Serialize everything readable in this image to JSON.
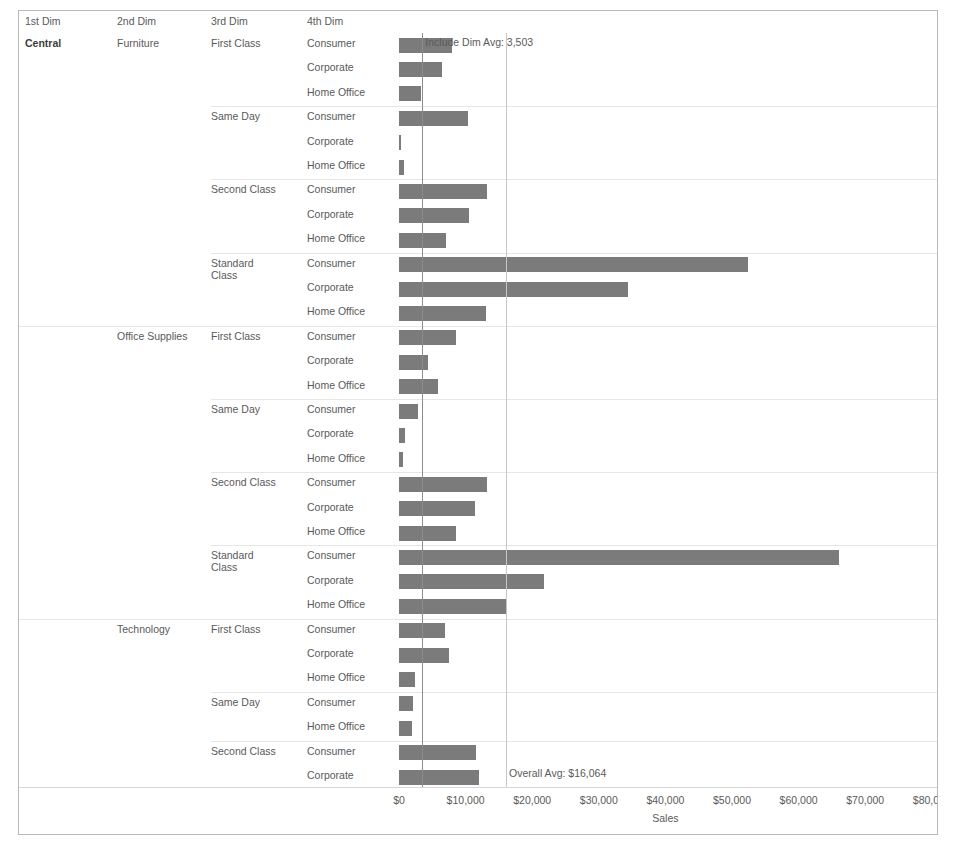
{
  "headers": {
    "dim1": "1st Dim",
    "dim2": "2nd Dim",
    "dim3": "3rd Dim",
    "dim4": "4th Dim"
  },
  "reference_lines": [
    {
      "name": "include-dim-avg",
      "label": "Include Dim Avg: 3,503",
      "value": 3503,
      "color": "#8d8d8d"
    },
    {
      "name": "overall-avg",
      "label": "Overall Avg: $16,064",
      "value": 16064,
      "color": "#c6c6c6"
    }
  ],
  "chart_data": {
    "type": "bar",
    "orientation": "horizontal",
    "title": "",
    "xlabel": "Sales",
    "ylabel": "",
    "xlim": [
      0,
      85000
    ],
    "xticks": [
      0,
      10000,
      20000,
      30000,
      40000,
      50000,
      60000,
      70000,
      80000
    ],
    "xticklabels": [
      "$0",
      "$10,000",
      "$20,000",
      "$30,000",
      "$40,000",
      "$50,000",
      "$60,000",
      "$70,000",
      "$80,000"
    ],
    "grid": false,
    "legend": "none",
    "bar_color": "#7b7b7b",
    "dimensions": [
      "1st Dim",
      "2nd Dim",
      "3rd Dim",
      "4th Dim"
    ],
    "rows": [
      {
        "dim1": "Central",
        "dim2": "Furniture",
        "dim3": "First Class",
        "dim4": "Consumer",
        "value": 8000,
        "group_start": true,
        "cat_start": true,
        "region_start": true
      },
      {
        "dim1": "",
        "dim2": "",
        "dim3": "",
        "dim4": "Corporate",
        "value": 6400,
        "group_start": false,
        "cat_start": false,
        "region_start": false
      },
      {
        "dim1": "",
        "dim2": "",
        "dim3": "",
        "dim4": "Home Office",
        "value": 3300,
        "group_start": false,
        "cat_start": false,
        "region_start": false
      },
      {
        "dim1": "",
        "dim2": "",
        "dim3": "Same Day",
        "dim4": "Consumer",
        "value": 10400,
        "group_start": true,
        "cat_start": false,
        "region_start": false
      },
      {
        "dim1": "",
        "dim2": "",
        "dim3": "",
        "dim4": "Corporate",
        "value": 200,
        "group_start": false,
        "cat_start": false,
        "region_start": false
      },
      {
        "dim1": "",
        "dim2": "",
        "dim3": "",
        "dim4": "Home Office",
        "value": 800,
        "group_start": false,
        "cat_start": false,
        "region_start": false
      },
      {
        "dim1": "",
        "dim2": "",
        "dim3": "Second Class",
        "dim4": "Consumer",
        "value": 13200,
        "group_start": true,
        "cat_start": false,
        "region_start": false
      },
      {
        "dim1": "",
        "dim2": "",
        "dim3": "",
        "dim4": "Corporate",
        "value": 10500,
        "group_start": false,
        "cat_start": false,
        "region_start": false
      },
      {
        "dim1": "",
        "dim2": "",
        "dim3": "",
        "dim4": "Home Office",
        "value": 7100,
        "group_start": false,
        "cat_start": false,
        "region_start": false
      },
      {
        "dim1": "",
        "dim2": "",
        "dim3": "Standard Class",
        "dim4": "Consumer",
        "value": 52400,
        "group_start": true,
        "cat_start": false,
        "region_start": false
      },
      {
        "dim1": "",
        "dim2": "",
        "dim3": "",
        "dim4": "Corporate",
        "value": 34400,
        "group_start": false,
        "cat_start": false,
        "region_start": false
      },
      {
        "dim1": "",
        "dim2": "",
        "dim3": "",
        "dim4": "Home Office",
        "value": 13000,
        "group_start": false,
        "cat_start": false,
        "region_start": false
      },
      {
        "dim1": "",
        "dim2": "Office Supplies",
        "dim3": "First Class",
        "dim4": "Consumer",
        "value": 8500,
        "group_start": true,
        "cat_start": true,
        "region_start": false
      },
      {
        "dim1": "",
        "dim2": "",
        "dim3": "",
        "dim4": "Corporate",
        "value": 4300,
        "group_start": false,
        "cat_start": false,
        "region_start": false
      },
      {
        "dim1": "",
        "dim2": "",
        "dim3": "",
        "dim4": "Home Office",
        "value": 5800,
        "group_start": false,
        "cat_start": false,
        "region_start": false
      },
      {
        "dim1": "",
        "dim2": "",
        "dim3": "Same Day",
        "dim4": "Consumer",
        "value": 2800,
        "group_start": true,
        "cat_start": false,
        "region_start": false
      },
      {
        "dim1": "",
        "dim2": "",
        "dim3": "",
        "dim4": "Corporate",
        "value": 900,
        "group_start": false,
        "cat_start": false,
        "region_start": false
      },
      {
        "dim1": "",
        "dim2": "",
        "dim3": "",
        "dim4": "Home Office",
        "value": 600,
        "group_start": false,
        "cat_start": false,
        "region_start": false
      },
      {
        "dim1": "",
        "dim2": "",
        "dim3": "Second Class",
        "dim4": "Consumer",
        "value": 13200,
        "group_start": true,
        "cat_start": false,
        "region_start": false
      },
      {
        "dim1": "",
        "dim2": "",
        "dim3": "",
        "dim4": "Corporate",
        "value": 11400,
        "group_start": false,
        "cat_start": false,
        "region_start": false
      },
      {
        "dim1": "",
        "dim2": "",
        "dim3": "",
        "dim4": "Home Office",
        "value": 8500,
        "group_start": false,
        "cat_start": false,
        "region_start": false
      },
      {
        "dim1": "",
        "dim2": "",
        "dim3": "Standard Class",
        "dim4": "Consumer",
        "value": 66000,
        "group_start": true,
        "cat_start": false,
        "region_start": false
      },
      {
        "dim1": "",
        "dim2": "",
        "dim3": "",
        "dim4": "Corporate",
        "value": 21700,
        "group_start": false,
        "cat_start": false,
        "region_start": false
      },
      {
        "dim1": "",
        "dim2": "",
        "dim3": "",
        "dim4": "Home Office",
        "value": 16000,
        "group_start": false,
        "cat_start": false,
        "region_start": false
      },
      {
        "dim1": "",
        "dim2": "Technology",
        "dim3": "First Class",
        "dim4": "Consumer",
        "value": 6900,
        "group_start": true,
        "cat_start": true,
        "region_start": false
      },
      {
        "dim1": "",
        "dim2": "",
        "dim3": "",
        "dim4": "Corporate",
        "value": 7500,
        "group_start": false,
        "cat_start": false,
        "region_start": false
      },
      {
        "dim1": "",
        "dim2": "",
        "dim3": "",
        "dim4": "Home Office",
        "value": 2400,
        "group_start": false,
        "cat_start": false,
        "region_start": false
      },
      {
        "dim1": "",
        "dim2": "",
        "dim3": "Same Day",
        "dim4": "Consumer",
        "value": 2100,
        "group_start": true,
        "cat_start": false,
        "region_start": false
      },
      {
        "dim1": "",
        "dim2": "",
        "dim3": "",
        "dim4": "Home Office",
        "value": 2000,
        "group_start": false,
        "cat_start": false,
        "region_start": false
      },
      {
        "dim1": "",
        "dim2": "",
        "dim3": "Second Class",
        "dim4": "Consumer",
        "value": 11600,
        "group_start": true,
        "cat_start": false,
        "region_start": false
      },
      {
        "dim1": "",
        "dim2": "",
        "dim3": "",
        "dim4": "Corporate",
        "value": 12000,
        "group_start": false,
        "cat_start": false,
        "region_start": false
      }
    ]
  }
}
